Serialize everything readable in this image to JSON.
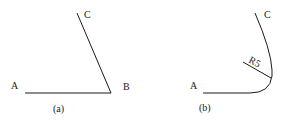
{
  "figure_a": {
    "caption": "(a)",
    "points": {
      "A": "A",
      "B": "B",
      "C": "C"
    }
  },
  "figure_b": {
    "caption": "(b)",
    "points": {
      "A": "A",
      "C": "C"
    },
    "radius_label": "R5"
  },
  "colors": {
    "line": "#1a1a1a",
    "background": "#ffffff"
  }
}
